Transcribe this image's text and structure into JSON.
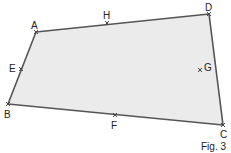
{
  "figure": {
    "caption": "Fig. 3",
    "shape": "quadrilateral",
    "fill_color": "#ebebeb",
    "stroke_color": "#555555",
    "vertices": [
      {
        "name": "A",
        "x": 36,
        "y": 32,
        "lx": 34,
        "ly": 28
      },
      {
        "name": "D",
        "x": 209,
        "y": 14,
        "lx": 209,
        "ly": 11
      },
      {
        "name": "C",
        "x": 223,
        "y": 125,
        "lx": 224,
        "ly": 138
      },
      {
        "name": "B",
        "x": 8,
        "y": 104,
        "lx": 7,
        "ly": 117
      }
    ],
    "midpoints": [
      {
        "name": "H",
        "x": 107,
        "y": 23,
        "lx": 107,
        "ly": 18,
        "side": "AD"
      },
      {
        "name": "G",
        "x": 200,
        "y": 70,
        "lx": 209,
        "ly": 70,
        "side": "DC"
      },
      {
        "name": "F",
        "x": 115,
        "y": 115,
        "lx": 115,
        "ly": 128,
        "side": "CB"
      },
      {
        "name": "E",
        "x": 21,
        "y": 69,
        "lx": 13,
        "ly": 72,
        "side": "BA"
      }
    ],
    "labels": {
      "A": "A",
      "B": "B",
      "C": "C",
      "D": "D",
      "E": "E",
      "F": "F",
      "G": "G",
      "H": "H"
    }
  }
}
